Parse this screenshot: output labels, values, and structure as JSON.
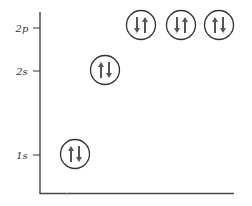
{
  "diagram": {
    "type": "orbital-energy-diagram",
    "levels": [
      {
        "label": "2p",
        "y": 28,
        "orbitals": [
          {
            "cx": 141,
            "cy": 25,
            "spins": [
              "down",
              "up"
            ]
          },
          {
            "cx": 181,
            "cy": 25,
            "spins": [
              "down",
              "up"
            ]
          },
          {
            "cx": 219,
            "cy": 25,
            "spins": [
              "up",
              "down"
            ]
          }
        ]
      },
      {
        "label": "2s",
        "y": 71,
        "orbitals": [
          {
            "cx": 105,
            "cy": 70,
            "spins": [
              "up",
              "down"
            ]
          }
        ]
      },
      {
        "label": "1s",
        "y": 155,
        "orbitals": [
          {
            "cx": 75,
            "cy": 154,
            "spins": [
              "up",
              "down"
            ]
          }
        ]
      }
    ],
    "colors": {
      "axis": "#333333",
      "circle": "#333333",
      "arrow": "#555555"
    }
  }
}
